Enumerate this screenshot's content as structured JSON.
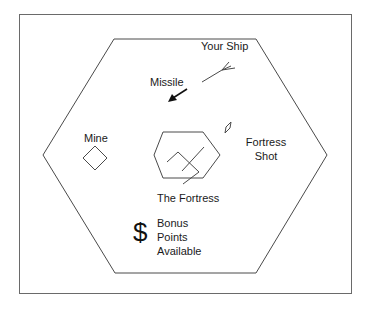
{
  "diagram": {
    "labels": {
      "your_ship": "Your Ship",
      "missile": "Missile",
      "mine": "Mine",
      "fortress_shot_line1": "Fortress",
      "fortress_shot_line2": "Shot",
      "the_fortress": "The Fortress",
      "bonus_symbol": "$",
      "bonus_line1": "Bonus",
      "bonus_line2": "Points",
      "bonus_line3": "Available"
    },
    "elements": [
      {
        "id": "outer-frame",
        "shape": "rectangle"
      },
      {
        "id": "outer-hexagon",
        "shape": "hexagon"
      },
      {
        "id": "your-ship",
        "shape": "ship-glyph"
      },
      {
        "id": "missile",
        "shape": "arrow"
      },
      {
        "id": "mine",
        "shape": "diamond"
      },
      {
        "id": "fortress-shot",
        "shape": "small-diamond"
      },
      {
        "id": "fortress",
        "shape": "small-hexagon-with-cannon"
      },
      {
        "id": "bonus",
        "shape": "dollar-sign"
      }
    ],
    "colors": {
      "stroke": "#4a4a4a",
      "text": "#1a1a1a",
      "background": "#ffffff"
    }
  }
}
